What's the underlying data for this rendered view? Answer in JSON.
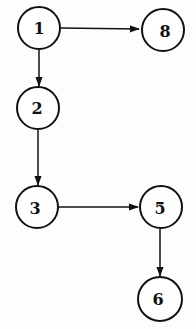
{
  "diagram": {
    "type": "directed-graph",
    "nodes": [
      {
        "id": "1",
        "label": "1",
        "cx": 39,
        "cy": 28
      },
      {
        "id": "8",
        "label": "8",
        "cx": 163,
        "cy": 30
      },
      {
        "id": "2",
        "label": "2",
        "cx": 38,
        "cy": 108
      },
      {
        "id": "3",
        "label": "3",
        "cx": 37,
        "cy": 207
      },
      {
        "id": "5",
        "label": "5",
        "cx": 161,
        "cy": 207
      },
      {
        "id": "6",
        "label": "6",
        "cx": 160,
        "cy": 299
      }
    ],
    "edges": [
      {
        "from": "1",
        "to": "8"
      },
      {
        "from": "1",
        "to": "2"
      },
      {
        "from": "2",
        "to": "3"
      },
      {
        "from": "3",
        "to": "5"
      },
      {
        "from": "5",
        "to": "6"
      }
    ],
    "colors": {
      "stroke": "#111111",
      "fill": "#ffffff",
      "background": "#fdfdfd"
    }
  }
}
